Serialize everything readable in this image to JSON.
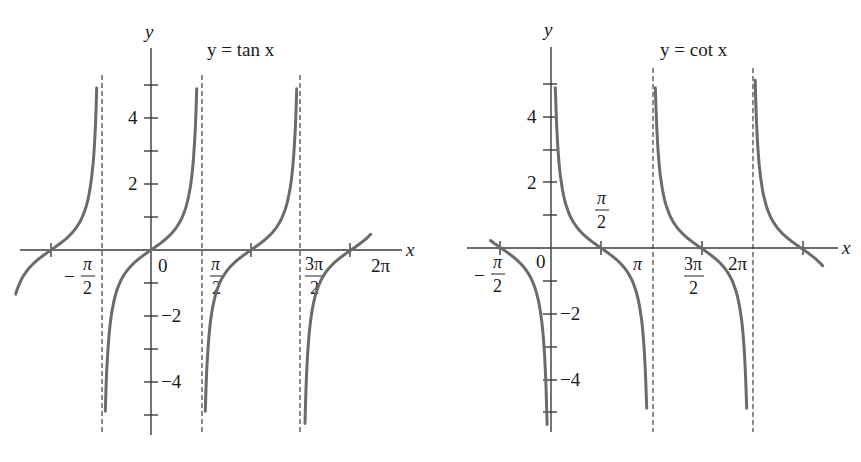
{
  "figure": {
    "left_panel": {
      "title": "y = tan x",
      "y_axis_label": "y",
      "x_axis_label": "x"
    },
    "right_panel": {
      "title": "y = cot x",
      "y_axis_label": "y",
      "x_axis_label": "x"
    }
  },
  "chart_data": [
    {
      "type": "line",
      "title": "y = tan x",
      "xlabel": "x",
      "ylabel": "y",
      "function": "tan",
      "x_tick_labels": [
        "-π/2",
        "0",
        "π/2",
        "3π/2",
        "2π"
      ],
      "x_tick_values": [
        -1.5708,
        0,
        1.5708,
        4.7124,
        6.2832
      ],
      "y_tick_labels": [
        "4",
        "2",
        "-2",
        "-4"
      ],
      "y_tick_values": [
        4,
        2,
        -2,
        -4
      ],
      "y_minor_ticks": [
        5,
        3,
        1,
        -1,
        -3,
        -5
      ],
      "zero_crossings": [
        -3.1416,
        0,
        3.1416,
        6.2832
      ],
      "vertical_asymptotes": [
        -1.5708,
        1.5708,
        4.7124
      ],
      "xlim": [
        -4.3,
        7.7
      ],
      "ylim": [
        -5.5,
        6
      ],
      "grid": false
    },
    {
      "type": "line",
      "title": "y = cot x",
      "xlabel": "x",
      "ylabel": "y",
      "function": "cot",
      "x_tick_labels": [
        "-π/2",
        "0",
        "π/2",
        "π",
        "3π/2",
        "2π"
      ],
      "x_tick_values": [
        -1.5708,
        0,
        1.5708,
        3.1416,
        4.7124,
        6.2832
      ],
      "y_tick_labels": [
        "4",
        "2",
        "-2",
        "-4"
      ],
      "y_tick_values": [
        4,
        2,
        -2,
        -4
      ],
      "y_minor_ticks": [
        5,
        3,
        1,
        -1,
        -3,
        -5
      ],
      "zero_crossings": [
        -1.5708,
        1.5708,
        4.7124,
        7.854
      ],
      "vertical_asymptotes": [
        0,
        3.1416,
        6.2832
      ],
      "xlim": [
        -2.7,
        9.2
      ],
      "ylim": [
        -5.5,
        6
      ],
      "grid": false
    }
  ],
  "labels": {
    "pi": "π",
    "two": "2",
    "three_pi": "3π",
    "two_pi": "2π",
    "minus": "−",
    "zero": "0",
    "four": "4",
    "two_num": "2",
    "neg_two": "−2",
    "neg_four": "−4",
    "y": "y",
    "x": "x"
  }
}
